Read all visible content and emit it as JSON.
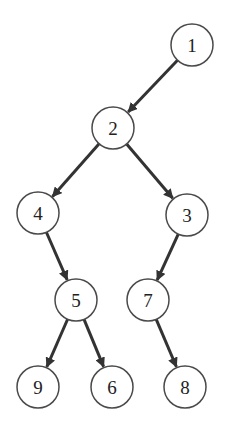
{
  "diagram": {
    "type": "binary-tree",
    "node_radius": 21,
    "colors": {
      "stroke": "#4a4a4a",
      "edge": "#333333",
      "fill": "#ffffff",
      "text": "#222222"
    },
    "nodes": [
      {
        "id": "1",
        "label": "1",
        "x": 192,
        "y": 45
      },
      {
        "id": "2",
        "label": "2",
        "x": 113,
        "y": 128
      },
      {
        "id": "4",
        "label": "4",
        "x": 38,
        "y": 213
      },
      {
        "id": "3",
        "label": "3",
        "x": 187,
        "y": 215
      },
      {
        "id": "5",
        "label": "5",
        "x": 76,
        "y": 300
      },
      {
        "id": "7",
        "label": "7",
        "x": 148,
        "y": 300
      },
      {
        "id": "9",
        "label": "9",
        "x": 38,
        "y": 387
      },
      {
        "id": "6",
        "label": "6",
        "x": 112,
        "y": 387
      },
      {
        "id": "8",
        "label": "8",
        "x": 185,
        "y": 387
      }
    ],
    "edges": [
      {
        "from": "1",
        "to": "2"
      },
      {
        "from": "2",
        "to": "4"
      },
      {
        "from": "2",
        "to": "3"
      },
      {
        "from": "4",
        "to": "5"
      },
      {
        "from": "3",
        "to": "7"
      },
      {
        "from": "5",
        "to": "9"
      },
      {
        "from": "5",
        "to": "6"
      },
      {
        "from": "7",
        "to": "8"
      }
    ]
  }
}
